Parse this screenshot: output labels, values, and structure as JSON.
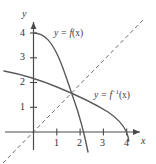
{
  "figure": {
    "background_color": "#ffffff",
    "curve_color": "#5a5a5a",
    "axis_color": "#4a4a4a",
    "text_color": "#333333"
  },
  "axes": {
    "x_axis_name": "x",
    "y_axis_name": "y",
    "x_label": "x",
    "y_label": "y",
    "x_ticks": [
      "1",
      "2",
      "3",
      "4"
    ],
    "y_ticks": [
      "1",
      "2",
      "3",
      "4"
    ],
    "x_tick_values": [
      1,
      2,
      3,
      4
    ],
    "y_tick_values": [
      1,
      2,
      3,
      4
    ],
    "xlim": [
      -1.4,
      5.1
    ],
    "ylim": [
      -1.3,
      5.4
    ],
    "grid": false
  },
  "labels": {
    "function_label_prefix": "y = ",
    "function_label_name": "f",
    "function_label_arg": "(x)",
    "inverse_label_prefix": "y = ",
    "inverse_label_name": "f",
    "inverse_label_sup": "−1",
    "inverse_label_arg": "(x)"
  },
  "curves": [
    {
      "name": "f",
      "style": "solid",
      "description": "decreasing concave curve from (0,4) crossing x-axis near x=2.1",
      "points": [
        [
          0,
          4
        ],
        [
          0.3,
          3.93
        ],
        [
          0.6,
          3.78
        ],
        [
          0.9,
          3.5
        ],
        [
          1.2,
          3.05
        ],
        [
          1.5,
          2.5
        ],
        [
          1.75,
          1.95
        ],
        [
          2.0,
          1.2
        ],
        [
          2.1,
          0.8
        ],
        [
          2.25,
          0.1
        ],
        [
          2.4,
          -0.6
        ],
        [
          2.5,
          -1.0
        ]
      ]
    },
    {
      "name": "f-inverse",
      "style": "solid",
      "description": "decreasing concave curve reaching x-axis at x=4, reflection of f across y = x",
      "points": [
        [
          -1.25,
          2.45
        ],
        [
          -0.6,
          2.35
        ],
        [
          0,
          2.25
        ],
        [
          0.6,
          2.1
        ],
        [
          1.2,
          1.85
        ],
        [
          1.75,
          1.5
        ],
        [
          2.3,
          1.2
        ],
        [
          3.0,
          0.85
        ],
        [
          3.5,
          0.55
        ],
        [
          3.85,
          0.25
        ],
        [
          4.0,
          0.0
        ],
        [
          4.05,
          -0.35
        ]
      ]
    },
    {
      "name": "identity-line",
      "style": "dashed",
      "description": "dashed line y = x",
      "points": [
        [
          -1.3,
          -1.3
        ],
        [
          4.8,
          4.8
        ]
      ]
    }
  ],
  "intersection": {
    "label": "",
    "point": [
      1.65,
      1.45
    ]
  }
}
